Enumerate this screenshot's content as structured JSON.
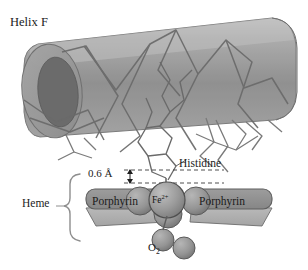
{
  "figure": {
    "background_color": "#ffffff"
  },
  "labels": {
    "helix_f": "Helix F",
    "distance": "0.6 Å",
    "histidine": "Histidine",
    "heme": "Heme",
    "porphyrin_left": "Porphyrin",
    "porphyrin_right": "Porphyrin",
    "iron_symbol": "Fe",
    "iron_charge": "2+",
    "oxygen_symbol": "O",
    "oxygen_subscript": "2"
  },
  "colors": {
    "cylinder_body": "#8d8d8d",
    "cylinder_edge": "#6f6f6f",
    "cylinder_cap_outer": "#9a9a9a",
    "cylinder_cap_inner": "#6a6a6a",
    "chain_line": "#6a6a6a",
    "porphyrin_top": "#8f8f8f",
    "porphyrin_side": "#b0b0b0",
    "porphyrin_edge": "#5e5e5e",
    "sphere_fe": "#9c9c9c",
    "sphere_neighbor": "#a8a8a8",
    "sphere_oxygen": "#8f8f8f",
    "sphere_edge": "#555555",
    "text": "#1c1c1c",
    "brace": "#8e8e8e",
    "dashed_guide": "#3a3a3a"
  },
  "elements": {
    "helix_cylinder": "large tilted translucent gray cylinder representing alpha Helix F",
    "polypeptide_chains": "zigzag gray backbone lines crossing the cylinder",
    "histidine_ring": "imidazole five-membered ring of the proximal histidine side chain",
    "porphyrin_slabs": "two gray rectangular slabs flanking the iron atom",
    "iron_sphere": "central sphere labelled Fe2+",
    "oxygen_pair": "two small gray spheres labelled O2 bound below the iron",
    "distance_marker": "dashed double-headed arrow indicating 0.6 angstrom displacement",
    "heme_brace": "curly brace grouping the porphyrin plane as the heme"
  },
  "icons": {
    "brace": "curly-brace-icon",
    "arrow": "double-arrow-icon"
  }
}
